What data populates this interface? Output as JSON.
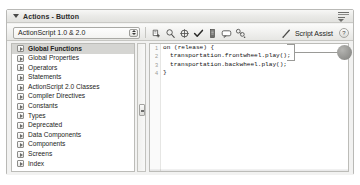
{
  "panel": {
    "title": "Actions - Button",
    "disclosure_icon": "triangle-down-icon",
    "menu_icon": "panel-options-icon"
  },
  "toolbar": {
    "language_select": {
      "value": "ActionScript 1.0 & 2.0",
      "stepper_icon": "stepper-updown-icon"
    },
    "icons": [
      {
        "name": "add-statement-icon",
        "title": "Add a new item to the script"
      },
      {
        "name": "find-icon",
        "title": "Find"
      },
      {
        "name": "insert-target-icon",
        "title": "Insert a target path"
      },
      {
        "name": "check-syntax-icon",
        "title": "Check syntax"
      },
      {
        "name": "auto-format-icon",
        "title": "Auto format"
      },
      {
        "name": "show-code-hint-icon",
        "title": "Show code hint"
      },
      {
        "name": "debug-options-icon",
        "title": "Debug options"
      }
    ],
    "script_assist": {
      "label": "Script Assist",
      "icon": "wand-icon"
    },
    "help": {
      "label": "?",
      "icon": "help-icon"
    }
  },
  "sidebar": {
    "items": [
      {
        "label": "Global Functions",
        "icon": "book-icon",
        "selected": true
      },
      {
        "label": "Global Properties",
        "icon": "book-icon",
        "selected": false
      },
      {
        "label": "Operators",
        "icon": "book-icon",
        "selected": false
      },
      {
        "label": "Statements",
        "icon": "book-icon",
        "selected": false
      },
      {
        "label": "ActionScript 2.0 Classes",
        "icon": "book-icon",
        "selected": false
      },
      {
        "label": "Compiler Directives",
        "icon": "book-icon",
        "selected": false
      },
      {
        "label": "Constants",
        "icon": "book-icon",
        "selected": false
      },
      {
        "label": "Types",
        "icon": "book-icon",
        "selected": false
      },
      {
        "label": "Deprecated",
        "icon": "book-icon",
        "selected": false
      },
      {
        "label": "Data Components",
        "icon": "book-icon",
        "selected": false
      },
      {
        "label": "Components",
        "icon": "book-icon",
        "selected": false
      },
      {
        "label": "Screens",
        "icon": "book-icon",
        "selected": false
      },
      {
        "label": "Index",
        "icon": "book-icon",
        "selected": false
      }
    ],
    "scrollbar": {
      "thumb_icon": "scroll-thumb-icon"
    }
  },
  "editor": {
    "line_numbers": [
      "1",
      "2",
      "3",
      "4"
    ],
    "lines": [
      {
        "indent": 0,
        "text": "on (release) {"
      },
      {
        "indent": 1,
        "text": "transportation.frontwheel.play();"
      },
      {
        "indent": 1,
        "text": "transportation.backwheel.play();"
      },
      {
        "indent": 0,
        "text": "}"
      }
    ]
  },
  "annotation": {
    "bracket_name": "callout-bracket",
    "leader_name": "callout-leader-line",
    "marker_label": ""
  },
  "colors": {
    "panel_bg": "#f2f2f1",
    "border": "#bcbcb8",
    "selection": "#d5d5d2",
    "code_text": "#111111",
    "marker": "#8f8f8c"
  }
}
